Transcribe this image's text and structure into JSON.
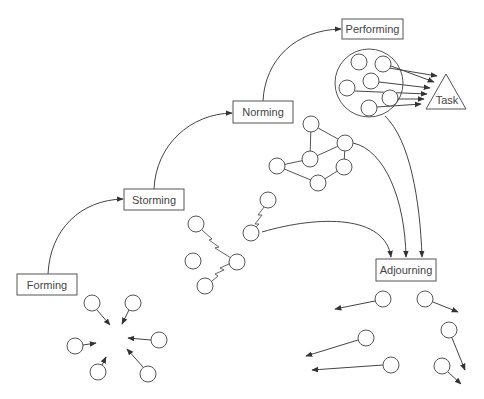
{
  "diagram": {
    "stages": [
      {
        "id": "forming",
        "label": "Forming",
        "x": 17,
        "y": 274,
        "w": 60,
        "h": 21
      },
      {
        "id": "storming",
        "label": "Storming",
        "x": 124,
        "y": 189,
        "w": 60,
        "h": 21
      },
      {
        "id": "norming",
        "label": "Norming",
        "x": 233,
        "y": 101,
        "w": 60,
        "h": 22
      },
      {
        "id": "performing",
        "label": "Performing",
        "x": 342,
        "y": 19,
        "w": 61,
        "h": 20
      },
      {
        "id": "adjourning",
        "label": "Adjourning",
        "x": 376,
        "y": 259,
        "w": 60,
        "h": 22
      }
    ],
    "task_label": "Task",
    "colors": {
      "stroke": "#555555",
      "text": "#444444",
      "background": "#ffffff"
    },
    "groups": {
      "forming_members": [
        [
          92,
          303
        ],
        [
          133,
          303
        ],
        [
          159,
          340
        ],
        [
          75,
          346
        ],
        [
          98,
          372
        ],
        [
          148,
          374
        ]
      ],
      "storming_members": [
        [
          268,
          200
        ],
        [
          251,
          233
        ],
        [
          196,
          224
        ],
        [
          193,
          261
        ],
        [
          237,
          262
        ],
        [
          205,
          286
        ]
      ],
      "norming_members": [
        [
          311,
          124
        ],
        [
          345,
          143
        ],
        [
          310,
          159
        ],
        [
          277,
          166
        ],
        [
          344,
          167
        ],
        [
          318,
          183
        ]
      ],
      "performing_members": [
        [
          359,
          62
        ],
        [
          383,
          64
        ],
        [
          371,
          81
        ],
        [
          347,
          88
        ],
        [
          390,
          98
        ],
        [
          369,
          108
        ]
      ],
      "adjourning_members": [
        [
          383,
          299
        ],
        [
          425,
          299
        ],
        [
          366,
          338
        ],
        [
          391,
          365
        ],
        [
          449,
          330
        ],
        [
          442,
          366
        ]
      ]
    }
  }
}
